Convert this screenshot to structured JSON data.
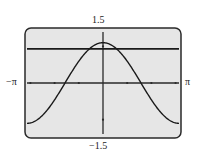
{
  "window": {
    "xmin_label": "−π",
    "xmax_label": "π",
    "ymin_label": "−1.5",
    "ymax_label": "1.5"
  },
  "colors": {
    "screen_bg": "#e6e6e6",
    "frame": "#2a2a2a",
    "curve": "#1a1a1a"
  },
  "chart_data": {
    "type": "line",
    "title": "",
    "xlabel": "",
    "ylabel": "",
    "xlim": [
      -3.14159,
      3.14159
    ],
    "ylim": [
      -1.5,
      1.5
    ],
    "x_tick_labels": [
      "−π",
      "π"
    ],
    "y_tick_labels": [
      "−1.5",
      "1.5"
    ],
    "x_tick_spacing": 1,
    "y_tick_spacing": 1,
    "grid": false,
    "legend": null,
    "series": [
      {
        "name": "y = 1.1·cos(x)",
        "function": "1.1*cos(x)",
        "x": [
          -3.14,
          -2.36,
          -1.57,
          -0.79,
          0,
          0.79,
          1.57,
          2.36,
          3.14
        ],
        "values": [
          -1.1,
          -0.78,
          0,
          0.78,
          1.1,
          0.78,
          0,
          -0.78,
          -1.1
        ]
      },
      {
        "name": "horizontal line",
        "function": "0.93",
        "x": [
          -3.14,
          3.14
        ],
        "values": [
          0.93,
          0.93
        ]
      }
    ]
  }
}
